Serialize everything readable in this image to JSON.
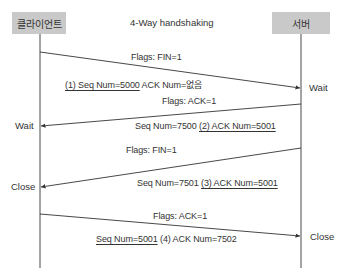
{
  "title": "4-Way handshaking",
  "participants": {
    "client": {
      "label": "클라이언트"
    },
    "server": {
      "label": "서버"
    }
  },
  "messages": [
    {
      "direction": "client-to-server",
      "flags": "Flags: FIN=1",
      "detail_parts": [
        "(1) Seq Num=5000",
        " ACK Num=없음"
      ],
      "underlined_part": 0,
      "end_state": "Wait",
      "end_side": "server"
    },
    {
      "direction": "server-to-client",
      "flags": "Flags: ACK=1",
      "detail_parts": [
        "Seq Num=7500 ",
        "(2) ACK Num=5001"
      ],
      "underlined_part": 1,
      "end_state": "Wait",
      "end_side": "client"
    },
    {
      "direction": "server-to-client",
      "flags": "Flags: FIN=1",
      "detail_parts": [
        "Seq Num=7501 ",
        "(3) ACK Num=5001"
      ],
      "underlined_part": 1,
      "end_state": "Close",
      "end_side": "client"
    },
    {
      "direction": "client-to-server",
      "flags": "Flags: ACK=1",
      "detail_parts": [
        "Seq Num=5001",
        " (4) ACK Num=7502"
      ],
      "underlined_part": 0,
      "end_state": "Close",
      "end_side": "server"
    }
  ],
  "colors": {
    "participant_box": "#c9c9c9",
    "line": "#333333",
    "text": "#333333"
  }
}
